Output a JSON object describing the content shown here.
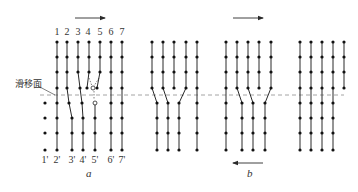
{
  "figure": {
    "slip_plane_label": "滑移面",
    "panel_a_label": "a",
    "panel_b_label": "b",
    "colors": {
      "line": "#2a2a2a",
      "dot": "#111111",
      "slip_plane": "#9a9a9a",
      "text": "#333333"
    },
    "slip_plane": {
      "y": 95,
      "x1": 40,
      "x2": 344
    },
    "slip_leader": {
      "x1": 38,
      "y1": 86,
      "x2": 55,
      "y2": 95
    },
    "slip_label_pos": {
      "x": 15,
      "y": 87
    },
    "panel_a_label_pos": {
      "x": 86,
      "y": 177
    },
    "panel_b_label_pos": {
      "x": 247,
      "y": 177
    },
    "arrows": [
      {
        "name": "shear-arrow-top-a",
        "x1": 75,
        "x2": 105,
        "y": 18
      },
      {
        "name": "shear-arrow-top-b",
        "x1": 233,
        "x2": 263,
        "y": 18
      },
      {
        "name": "shear-arrow-bottom-b",
        "x1": 263,
        "x2": 233,
        "y": 163
      }
    ],
    "top_labels": [
      {
        "text": "1",
        "x": 57
      },
      {
        "text": "2",
        "x": 67
      },
      {
        "text": "3",
        "x": 78
      },
      {
        "text": "4",
        "x": 88
      },
      {
        "text": "5",
        "x": 100
      },
      {
        "text": "6",
        "x": 111
      },
      {
        "text": "7",
        "x": 122
      }
    ],
    "top_labels_y": 35,
    "bottom_labels": [
      {
        "text": "1'",
        "x": 45
      },
      {
        "text": "2'",
        "x": 57
      },
      {
        "text": "3'",
        "x": 72
      },
      {
        "text": "4'",
        "x": 83
      },
      {
        "text": "5'",
        "x": 95
      },
      {
        "text": "6'",
        "x": 111
      },
      {
        "text": "7'",
        "x": 122
      }
    ],
    "bottom_labels_y": 163,
    "atom_columns": [
      {
        "panel": "a",
        "pts": [
          [
            57,
            42
          ],
          [
            57,
            57
          ],
          [
            57,
            72
          ],
          [
            57,
            88
          ],
          [
            57,
            103
          ],
          [
            57,
            118
          ],
          [
            57,
            133
          ],
          [
            57,
            150
          ]
        ]
      },
      {
        "panel": "a",
        "pts": [
          [
            67,
            42
          ],
          [
            67,
            57
          ],
          [
            67,
            72
          ],
          [
            67,
            88
          ],
          [
            69,
            103
          ],
          [
            72,
            118
          ],
          [
            72,
            133
          ],
          [
            72,
            150
          ]
        ]
      },
      {
        "panel": "a",
        "pts": [
          [
            78,
            42
          ],
          [
            78,
            57
          ],
          [
            78,
            72
          ],
          [
            80,
            88
          ],
          [
            82,
            103
          ],
          [
            83,
            118
          ],
          [
            83,
            133
          ],
          [
            83,
            150
          ]
        ]
      },
      {
        "panel": "a",
        "pts": [
          [
            89,
            42
          ],
          [
            89,
            57
          ],
          [
            89,
            72
          ],
          [
            87,
            88
          ]
        ]
      },
      {
        "panel": "a",
        "pts": [
          [
            100,
            42
          ],
          [
            100,
            57
          ],
          [
            100,
            72
          ],
          [
            97,
            88
          ]
        ]
      },
      {
        "panel": "a",
        "pts": [
          [
            95,
            103
          ],
          [
            95,
            118
          ],
          [
            95,
            133
          ],
          [
            95,
            150
          ]
        ]
      },
      {
        "panel": "a",
        "pts": [
          [
            111,
            42
          ],
          [
            111,
            57
          ],
          [
            111,
            72
          ],
          [
            111,
            88
          ],
          [
            111,
            103
          ],
          [
            111,
            118
          ],
          [
            111,
            133
          ],
          [
            111,
            150
          ]
        ]
      },
      {
        "panel": "a",
        "pts": [
          [
            122,
            42
          ],
          [
            122,
            57
          ],
          [
            122,
            72
          ],
          [
            122,
            88
          ],
          [
            122,
            103
          ],
          [
            122,
            118
          ],
          [
            122,
            133
          ],
          [
            122,
            150
          ]
        ]
      },
      {
        "panel": "a",
        "dots_only": true,
        "pts": [
          [
            45,
            103
          ],
          [
            45,
            118
          ],
          [
            45,
            133
          ],
          [
            45,
            150
          ]
        ]
      },
      {
        "panel": "b1",
        "pts": [
          [
            152,
            42
          ],
          [
            152,
            57
          ],
          [
            152,
            72
          ],
          [
            152,
            88
          ],
          [
            157,
            103
          ],
          [
            157,
            118
          ],
          [
            157,
            133
          ],
          [
            157,
            150
          ]
        ]
      },
      {
        "panel": "b1",
        "pts": [
          [
            163,
            42
          ],
          [
            163,
            57
          ],
          [
            163,
            72
          ],
          [
            163,
            88
          ],
          [
            168,
            103
          ],
          [
            168,
            118
          ],
          [
            168,
            133
          ],
          [
            168,
            150
          ]
        ]
      },
      {
        "panel": "b1",
        "pts": [
          [
            174,
            42
          ],
          [
            174,
            57
          ],
          [
            174,
            72
          ],
          [
            174,
            88
          ]
        ]
      },
      {
        "panel": "b1",
        "pts": [
          [
            186,
            42
          ],
          [
            186,
            57
          ],
          [
            186,
            72
          ],
          [
            186,
            88
          ],
          [
            179,
            103
          ],
          [
            179,
            118
          ],
          [
            179,
            133
          ],
          [
            179,
            150
          ]
        ]
      },
      {
        "panel": "b1",
        "pts": [
          [
            197,
            42
          ],
          [
            197,
            57
          ],
          [
            197,
            72
          ],
          [
            197,
            88
          ],
          [
            197,
            103
          ],
          [
            197,
            118
          ],
          [
            197,
            133
          ],
          [
            197,
            150
          ]
        ]
      },
      {
        "panel": "b2",
        "pts": [
          [
            226,
            42
          ],
          [
            226,
            57
          ],
          [
            226,
            72
          ],
          [
            226,
            88
          ],
          [
            226,
            103
          ],
          [
            226,
            118
          ],
          [
            226,
            133
          ],
          [
            226,
            150
          ]
        ]
      },
      {
        "panel": "b2",
        "pts": [
          [
            237,
            42
          ],
          [
            237,
            57
          ],
          [
            237,
            72
          ],
          [
            237,
            88
          ],
          [
            242,
            103
          ],
          [
            242,
            118
          ],
          [
            242,
            133
          ],
          [
            242,
            150
          ]
        ]
      },
      {
        "panel": "b2",
        "pts": [
          [
            248,
            42
          ],
          [
            248,
            57
          ],
          [
            248,
            72
          ],
          [
            248,
            88
          ],
          [
            253,
            103
          ],
          [
            253,
            118
          ],
          [
            253,
            133
          ],
          [
            253,
            150
          ]
        ]
      },
      {
        "panel": "b2",
        "pts": [
          [
            259,
            42
          ],
          [
            259,
            57
          ],
          [
            259,
            72
          ],
          [
            259,
            88
          ]
        ]
      },
      {
        "panel": "b2",
        "pts": [
          [
            271,
            42
          ],
          [
            271,
            57
          ],
          [
            271,
            72
          ],
          [
            271,
            88
          ],
          [
            265,
            103
          ],
          [
            265,
            118
          ],
          [
            265,
            133
          ],
          [
            265,
            150
          ]
        ]
      },
      {
        "panel": "b3",
        "pts": [
          [
            300,
            42
          ],
          [
            300,
            57
          ],
          [
            300,
            72
          ],
          [
            300,
            88
          ],
          [
            300,
            103
          ],
          [
            300,
            118
          ],
          [
            300,
            133
          ],
          [
            300,
            150
          ]
        ]
      },
      {
        "panel": "b3",
        "pts": [
          [
            311,
            42
          ],
          [
            311,
            57
          ],
          [
            311,
            72
          ],
          [
            311,
            88
          ],
          [
            311,
            103
          ],
          [
            311,
            118
          ],
          [
            311,
            133
          ],
          [
            311,
            150
          ]
        ]
      },
      {
        "panel": "b3",
        "pts": [
          [
            322,
            42
          ],
          [
            322,
            57
          ],
          [
            322,
            72
          ],
          [
            322,
            88
          ],
          [
            322,
            103
          ],
          [
            322,
            118
          ],
          [
            322,
            133
          ],
          [
            322,
            150
          ]
        ]
      },
      {
        "panel": "b3",
        "pts": [
          [
            333,
            42
          ],
          [
            333,
            57
          ],
          [
            333,
            72
          ],
          [
            333,
            88
          ],
          [
            333,
            103
          ],
          [
            333,
            118
          ],
          [
            333,
            133
          ],
          [
            333,
            150
          ]
        ]
      },
      {
        "panel": "b3",
        "pts": [
          [
            344,
            42
          ],
          [
            344,
            57
          ],
          [
            344,
            72
          ],
          [
            344,
            88
          ]
        ]
      }
    ],
    "dislocation_core": {
      "open_circles": [
        [
          93,
          88
        ],
        [
          95,
          103
        ]
      ],
      "helper_dashes": [
        [
          [
            89,
            78
          ],
          [
            92,
            86
          ]
        ],
        [
          [
            99,
            78
          ],
          [
            94,
            86
          ]
        ],
        [
          [
            94,
            91
          ],
          [
            94,
            100
          ]
        ]
      ]
    }
  }
}
